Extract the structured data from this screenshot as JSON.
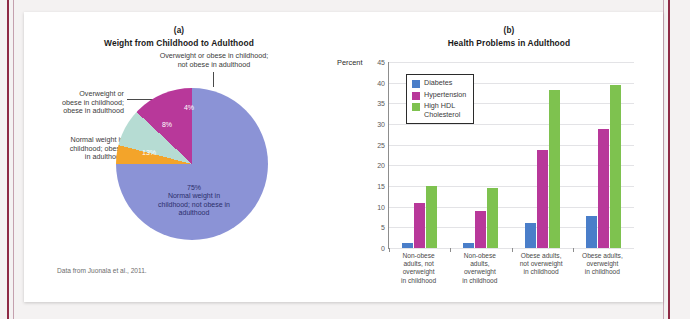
{
  "figure": {
    "source_note": "Data from Juonala et al., 2011."
  },
  "panel_a": {
    "letter": "(a)",
    "title": "Weight from Childhood to Adulthood",
    "callouts": {
      "top": "Overweight or obese in childhood;\nnot obese in adulthood",
      "top_line1": "Overweight or obese in childhood;",
      "top_line2": "not obese in adulthood",
      "upper_left_line1": "Overweight or",
      "upper_left_line2": "obese in childhood;",
      "upper_left_line3": "obese in adulthood",
      "lower_left_line1": "Normal weight in",
      "lower_left_line2": "childhood; obese",
      "lower_left_line3": "in adulthood"
    },
    "slice_labels": {
      "orange": "4%",
      "teal": "8%",
      "magenta": "13%",
      "blue_pct": "75%",
      "blue_l1": "Normal weight in",
      "blue_l2": "childhood; not obese in",
      "blue_l3": "adulthood"
    }
  },
  "panel_b": {
    "letter": "(b)",
    "title": "Health Problems in Adulthood",
    "axis_name": "Percent"
  },
  "colors": {
    "pie_blue": "#8b93d6",
    "pie_orange": "#f3a42a",
    "pie_teal": "#b6dcd3",
    "pie_magenta": "#b8389a",
    "bar_diabetes": "#4a7ec9",
    "bar_hypertension": "#b8389a",
    "bar_hdl": "#7ec24f",
    "rule_maroon": "#8e2a45"
  },
  "chart_data": [
    {
      "type": "pie",
      "title": "Weight from Childhood to Adulthood",
      "subtitle": "(a)",
      "legend": "none",
      "categories": [
        "Normal weight in childhood; not obese in adulthood",
        "Normal weight in childhood; obese in adulthood",
        "Overweight or obese in childhood; obese in adulthood",
        "Overweight or obese in childhood; not obese in adulthood"
      ],
      "values": [
        75,
        13,
        8,
        4
      ],
      "value_labels": [
        "75%",
        "13%",
        "8%",
        "4%"
      ],
      "colors": [
        "#8b93d6",
        "#b8389a",
        "#b6dcd3",
        "#f3a42a"
      ],
      "start_angle_deg": 270,
      "direction": "counterclockwise-from-12oclock",
      "annotation": "Data from Juonala et al., 2011."
    },
    {
      "type": "bar",
      "title": "Health Problems in Adulthood",
      "subtitle": "(b)",
      "xlabel": "",
      "ylabel": "Percent",
      "ylim": [
        0,
        45
      ],
      "yticks": [
        0,
        5,
        10,
        15,
        20,
        25,
        30,
        35,
        40,
        45
      ],
      "grid": true,
      "legend_position": "top-left-inside",
      "grouped": true,
      "categories": [
        "Non-obese adults, not overweight in childhood",
        "Non-obese adults, overweight in childhood",
        "Obese adults, not overweight in childhood",
        "Obese adults, overweight in childhood"
      ],
      "category_lines": [
        [
          "Non-obese",
          "adults, not",
          "overweight",
          "in childhood"
        ],
        [
          "Non-obese",
          "adults,",
          "overweight",
          "in childhood"
        ],
        [
          "Obese adults,",
          "not overweight",
          "in childhood"
        ],
        [
          "Obese adults,",
          "overweight",
          "in childhood"
        ]
      ],
      "series": [
        {
          "name": "Diabetes",
          "color": "#4a7ec9",
          "values": [
            1.2,
            1.3,
            6.0,
            7.7
          ]
        },
        {
          "name": "Hypertension",
          "color": "#b8389a",
          "values": [
            11.0,
            9.0,
            23.8,
            28.7
          ]
        },
        {
          "name": "High HDL Cholesterol",
          "color": "#7ec24f",
          "values": [
            15.1,
            14.5,
            38.3,
            39.5
          ]
        }
      ],
      "legend_labels": [
        [
          "Diabetes"
        ],
        [
          "Hypertension"
        ],
        [
          "High HDL",
          "Cholesterol"
        ]
      ]
    }
  ]
}
